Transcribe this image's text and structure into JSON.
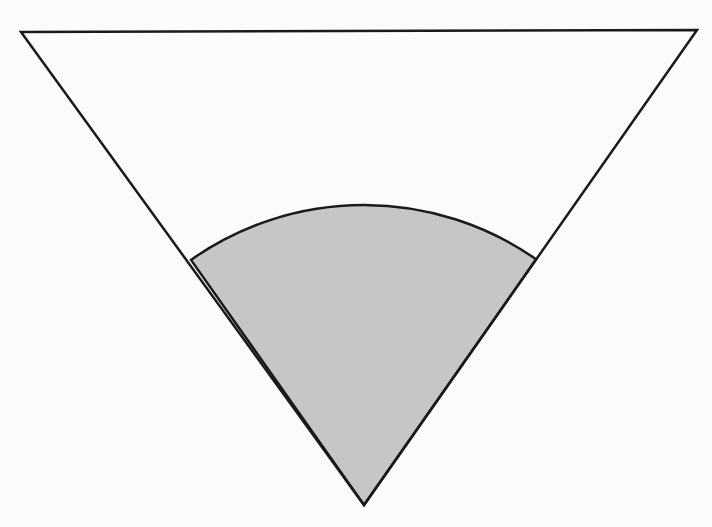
{
  "diagram": {
    "background_color": "#fbfbfb",
    "stroke_color": "#1a1a1a",
    "sector_fill": "#c6c6c6",
    "triangle": {
      "top_left": [
        21,
        32
      ],
      "top_right": [
        697,
        30
      ],
      "bottom": [
        364,
        505
      ]
    },
    "sector": {
      "center": [
        364,
        505
      ],
      "radius": 300,
      "left_point": [
        189,
        257
      ],
      "right_point": [
        537,
        258
      ]
    }
  }
}
